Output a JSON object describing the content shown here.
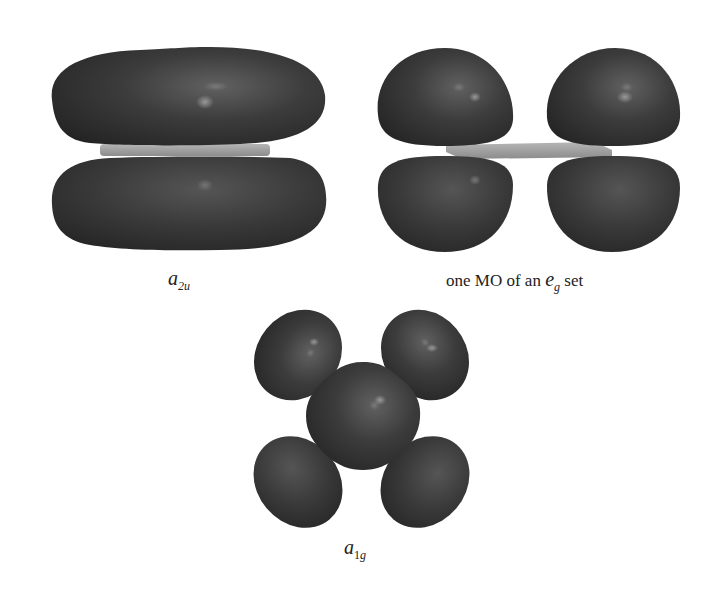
{
  "figure": {
    "panels": [
      {
        "id": "a2u",
        "label": {
          "main": "a",
          "subscript": "2u"
        },
        "description": "Two elongated lobes above and below a square-planar slab"
      },
      {
        "id": "eg",
        "label": {
          "prefix": "one MO of an ",
          "main": "e",
          "subscript": "g",
          "suffix": " set"
        },
        "description": "Four lobes, two above and two below a square-planar slab"
      },
      {
        "id": "a1g",
        "label": {
          "main": "a",
          "subscript_digit": "1",
          "subscript": "g"
        },
        "description": "Central rounded lobe over a square with four lobes at the corners"
      }
    ],
    "colors": {
      "lobe_dark": "#2a2a2a",
      "lobe_mid": "#4a4a4a",
      "lobe_highlight": "#8a8a8a",
      "slab": "#9a9a9a",
      "slab_light": "#b8b8b8",
      "background": "#ffffff"
    }
  }
}
